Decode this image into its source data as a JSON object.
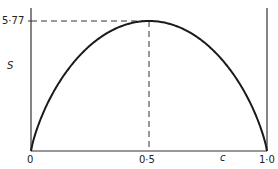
{
  "chart_data": {
    "type": "line",
    "title": "",
    "xlabel": "c",
    "ylabel": "S",
    "xlim": [
      0,
      1.0
    ],
    "ylim": [
      0,
      5.77
    ],
    "x_ticks": [
      "0",
      "0·5",
      "1·0"
    ],
    "y_ticks": [
      "5·77"
    ],
    "grid": false,
    "legend": null,
    "annotations": [
      {
        "type": "dashed-line",
        "description": "horizontal from y-axis at 5·77 to peak"
      },
      {
        "type": "dashed-line",
        "description": "vertical from peak down to c = 0·5"
      }
    ],
    "series": [
      {
        "name": "S(c)",
        "x": [
          0,
          0.05,
          0.1,
          0.2,
          0.3,
          0.4,
          0.5,
          0.6,
          0.7,
          0.8,
          0.9,
          0.95,
          1.0
        ],
        "y": [
          0,
          1.97,
          3.23,
          4.97,
          5.0,
          5.57,
          5.77,
          5.57,
          5.0,
          4.97,
          3.23,
          1.97,
          0
        ]
      }
    ]
  },
  "labels": {
    "y_max": "5·77",
    "y_axis": "S",
    "x_zero": "0",
    "x_mid": "0·5",
    "x_axis": "c",
    "x_max": "1·0"
  }
}
